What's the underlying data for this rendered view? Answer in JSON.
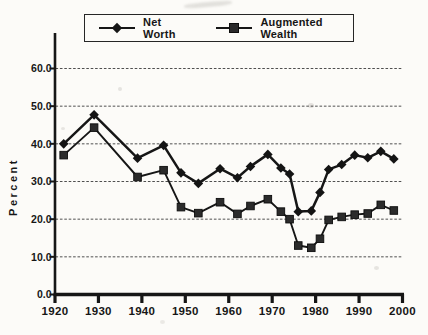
{
  "figure": {
    "background_color": "#fcfbf8",
    "ink_color": "#161616",
    "gridline_color": "#4f4f4f"
  },
  "legend": {
    "items": [
      {
        "label": "Net Worth",
        "marker": "diamond"
      },
      {
        "label": "Augmented Wealth",
        "marker": "square"
      }
    ]
  },
  "chart_data": {
    "type": "line",
    "title": "",
    "xlabel": "",
    "ylabel": "Percent",
    "xlim": [
      1920,
      2000
    ],
    "ylim": [
      0,
      60
    ],
    "grid": "horizontal-dashed",
    "legend_position": "top-center-boxed",
    "x_ticks": [
      1920,
      1930,
      1940,
      1950,
      1960,
      1970,
      1980,
      1990,
      2000
    ],
    "y_ticks": [
      0,
      10,
      20,
      30,
      40,
      50,
      60
    ],
    "y_tick_labels": [
      "0.0",
      "10.0",
      "20.0",
      "30.0",
      "40.0",
      "50.0",
      "60.0"
    ],
    "x_tick_labels": [
      "1920",
      "1930",
      "1940",
      "1950",
      "1960",
      "1970",
      "1980",
      "1990",
      "2000"
    ],
    "years": [
      1922,
      1929,
      1939,
      1945,
      1949,
      1953,
      1958,
      1962,
      1965,
      1969,
      1972,
      1974,
      1976,
      1979,
      1981,
      1983,
      1986,
      1989,
      1992,
      1995,
      1998
    ],
    "series": [
      {
        "name": "Net Worth",
        "marker": "diamond",
        "values": [
          40.0,
          47.7,
          36.2,
          39.6,
          32.3,
          29.5,
          33.4,
          31.0,
          34.0,
          37.2,
          33.6,
          32.0,
          22.0,
          22.2,
          27.1,
          33.2,
          34.5,
          37.0,
          36.3,
          38.0,
          36.0
        ]
      },
      {
        "name": "Augmented Wealth",
        "marker": "square",
        "values": [
          37.0,
          44.3,
          31.2,
          33.0,
          23.2,
          21.6,
          24.5,
          21.4,
          23.5,
          25.3,
          22.0,
          20.0,
          13.0,
          12.4,
          14.8,
          19.8,
          20.6,
          21.2,
          21.5,
          23.8,
          22.3
        ]
      }
    ]
  }
}
